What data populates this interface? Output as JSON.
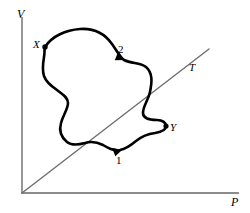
{
  "figure": {
    "kind": "pressure-volume-cycle-diagram",
    "background_color": "#ffffff",
    "curve_color": "#000000",
    "axis_color": "#8c8c8c",
    "isotherm_color": "#6e6e6e"
  },
  "axes": {
    "vertical": {
      "label": "V",
      "name": "volume-axis",
      "x": 22,
      "y_top": 18,
      "y_bottom": 193
    },
    "horizontal": {
      "label": "P",
      "name": "pressure-axis",
      "y": 193,
      "x_left": 22,
      "x_right": 238
    }
  },
  "isotherm": {
    "label": "T",
    "name": "isotherm-line",
    "x1": 22,
    "y1": 193,
    "x2": 209,
    "y2": 49
  },
  "markers": [
    {
      "label": "X",
      "name": "point-x",
      "x": 45,
      "y": 47
    },
    {
      "label": "Y",
      "name": "point-y",
      "x": 166,
      "y": 126
    }
  ],
  "direction_arrows": [
    {
      "label": "2",
      "name": "arrow-step-2",
      "x": 120,
      "y": 60,
      "angle": 28
    },
    {
      "label": "1",
      "name": "arrow-step-1",
      "x": 120,
      "y": 150,
      "angle": -18
    }
  ],
  "cycle_path": {
    "name": "thermodynamic-cycle-curve",
    "stroke_width": 2.6,
    "d": "M 45,47 C 52,36 66,30 80,29 C 95,28 105,34 112,44 C 117,51 120,57 124,60 C 132,64 140,62 146,67 C 153,73 152,82 150,92 C 148,101 143,106 143,113 C 143,119 150,120 157,120 C 163,120 166,123 166,126 C 166,130 161,132 155,133 C 147,134 141,137 136,141 C 130,146 126,149 120,150 C 113,151 108,148 103,145 C 97,142 91,141 85,143 C 78,145 72,146 67,142 C 61,137 59,130 61,123 C 63,115 68,109 68,103 C 68,97 62,94 57,90 C 51,86 46,82 44,76 C 42,70 43,63 44,57 C 45,52 44,50 45,47 Z"
  }
}
